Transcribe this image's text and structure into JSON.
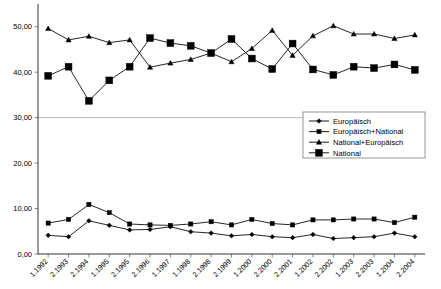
{
  "chart_data": {
    "type": "line",
    "title": "",
    "subtitle": "",
    "xlabel": "",
    "ylabel": "",
    "ylim": [
      0,
      55
    ],
    "yticks": [
      0,
      10,
      20,
      30,
      40,
      50
    ],
    "ytick_labels": [
      "0,00",
      "10,00",
      "20,00",
      "30,00",
      "40,00",
      "50,00"
    ],
    "grid": "horizontal-at-30-only",
    "legend_position": "center-right",
    "categories": [
      "1.1992",
      "2.1993",
      "2.1994",
      "1.1995",
      "2.1995",
      "2.1996",
      "1.1997",
      "1.1998",
      "2.1998",
      "2.1999",
      "1.2000",
      "2.2000",
      "2.2001",
      "1.2002",
      "2.2002",
      "1.2003",
      "2.2003",
      "1.2004",
      "2.2004"
    ],
    "series": [
      {
        "name": "Europäisch",
        "marker": "diamond",
        "values": [
          4.1,
          3.8,
          7.3,
          6.3,
          5.3,
          5.4,
          6.0,
          4.9,
          4.6,
          4.0,
          4.3,
          3.8,
          3.6,
          4.3,
          3.4,
          3.6,
          3.8,
          4.6,
          3.8
        ]
      },
      {
        "name": "Europäisch+National",
        "marker": "square-small",
        "values": [
          6.8,
          7.6,
          10.9,
          9.1,
          6.6,
          6.4,
          6.3,
          6.6,
          7.1,
          6.4,
          7.6,
          6.7,
          6.4,
          7.5,
          7.5,
          7.7,
          7.7,
          6.9,
          8.1
        ]
      },
      {
        "name": "National+Europäisch",
        "marker": "triangle",
        "values": [
          49.6,
          47.1,
          47.9,
          46.5,
          47.1,
          41.1,
          42.0,
          42.8,
          44.2,
          42.3,
          45.2,
          49.2,
          43.7,
          48.0,
          50.2,
          48.4,
          48.4,
          47.4,
          48.2
        ]
      },
      {
        "name": "National",
        "marker": "square-large",
        "values": [
          39.2,
          41.2,
          33.7,
          38.2,
          41.2,
          47.5,
          46.4,
          45.8,
          44.2,
          47.3,
          43.0,
          40.7,
          46.3,
          40.6,
          39.4,
          41.2,
          40.9,
          41.7,
          40.5
        ]
      }
    ]
  },
  "legend": {
    "items": [
      {
        "label": "Europäisch",
        "marker": "diamond"
      },
      {
        "label": "Europäisch+National",
        "marker": "square-small"
      },
      {
        "label": "National+Europäisch",
        "marker": "triangle"
      },
      {
        "label": "National",
        "marker": "square-large"
      }
    ]
  },
  "colors": {
    "series": "#000000",
    "grid": "#9a9a9a",
    "axis": "#000000",
    "background": "#ffffff"
  }
}
